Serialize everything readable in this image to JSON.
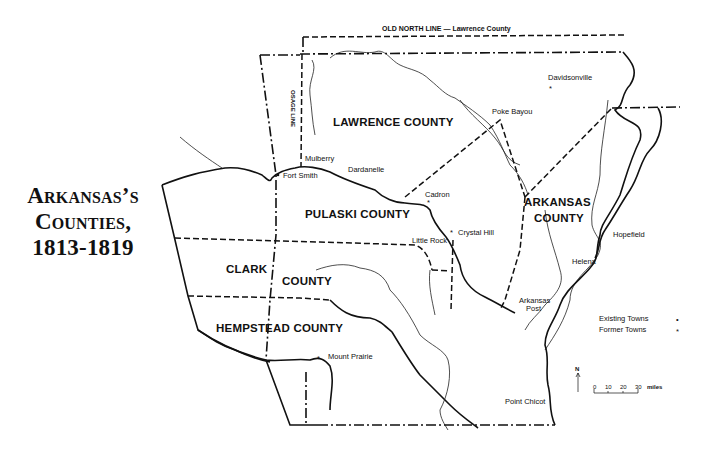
{
  "title": {
    "line1": "Arkansas’s",
    "line2": "Counties,",
    "line3": "1813-1819"
  },
  "map": {
    "header_line": "OLD NORTH LINE — Lawrence County",
    "osage_line": "OSAGE LINE",
    "counties": [
      {
        "name": "LAWRENCE COUNTY"
      },
      {
        "name": "PULASKI COUNTY"
      },
      {
        "name": "ARKANSAS"
      },
      {
        "name": "COUNTY"
      },
      {
        "name": "CLARK"
      },
      {
        "name": "COUNTY"
      },
      {
        "name": "HEMPSTEAD COUNTY"
      }
    ],
    "towns": [
      {
        "name": "Davidsonville",
        "type": "former"
      },
      {
        "name": "Poke Bayou",
        "type": "former"
      },
      {
        "name": "Mulberry",
        "type": "existing"
      },
      {
        "name": "Fort Smith",
        "type": "existing"
      },
      {
        "name": "Dardanelle",
        "type": "existing"
      },
      {
        "name": "Cadron",
        "type": "former"
      },
      {
        "name": "Crystal Hill",
        "type": "former"
      },
      {
        "name": "Little Rock",
        "type": "existing"
      },
      {
        "name": "Hopefield",
        "type": "existing"
      },
      {
        "name": "Helena",
        "type": "existing"
      },
      {
        "name": "Arkansas",
        "type": "former"
      },
      {
        "name": "Post",
        "type": "former"
      },
      {
        "name": "Mount Prairie",
        "type": "former"
      },
      {
        "name": "Point Chicot",
        "type": "former"
      }
    ]
  },
  "legend": {
    "existing_label": "Existing Towns",
    "existing_symbol": "•",
    "former_label": "Former Towns",
    "former_symbol": "*"
  },
  "scale": {
    "north": "N",
    "ticks": [
      "0",
      "10",
      "20",
      "30"
    ],
    "unit": "miles"
  }
}
